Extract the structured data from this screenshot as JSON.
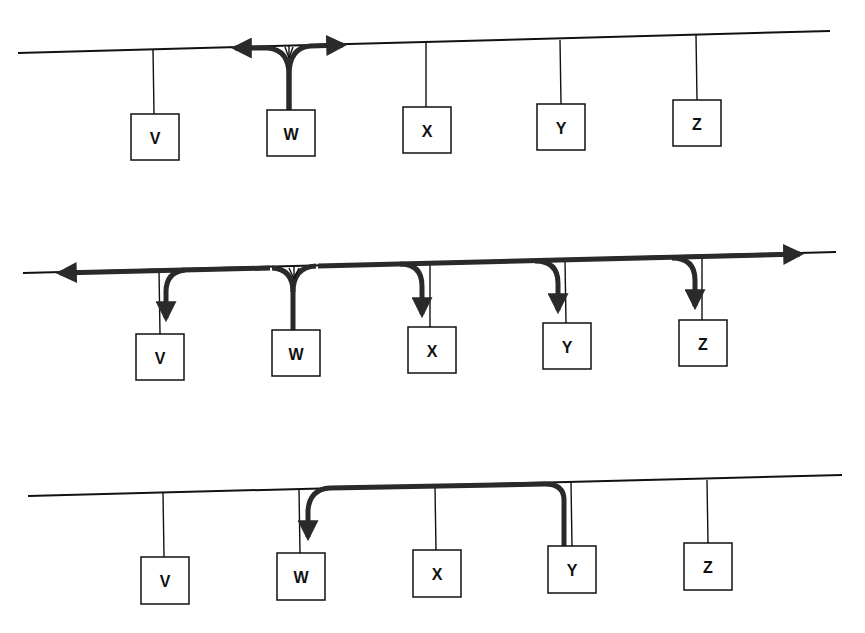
{
  "diagram": {
    "panels": [
      {
        "name": "top",
        "description": "Station W transmits onto the bus; signal propagates in both directions",
        "nodes": [
          {
            "label": "V"
          },
          {
            "label": "W"
          },
          {
            "label": "X"
          },
          {
            "label": "Y"
          },
          {
            "label": "Z"
          }
        ],
        "source": "W",
        "destinations": []
      },
      {
        "name": "middle",
        "description": "Transmission from W propagates along entire bus and is received by all stations",
        "nodes": [
          {
            "label": "V"
          },
          {
            "label": "W"
          },
          {
            "label": "X"
          },
          {
            "label": "Y"
          },
          {
            "label": "Z"
          }
        ],
        "source": "W",
        "destinations": [
          "V",
          "X",
          "Y",
          "Z"
        ]
      },
      {
        "name": "bottom",
        "description": "Station Y sends to station W",
        "nodes": [
          {
            "label": "V"
          },
          {
            "label": "W"
          },
          {
            "label": "X"
          },
          {
            "label": "Y"
          },
          {
            "label": "Z"
          }
        ],
        "source": "Y",
        "destinations": [
          "W"
        ]
      }
    ],
    "colors": {
      "line": "#111111",
      "signal": "#2a2a2a",
      "background": "#ffffff"
    }
  }
}
